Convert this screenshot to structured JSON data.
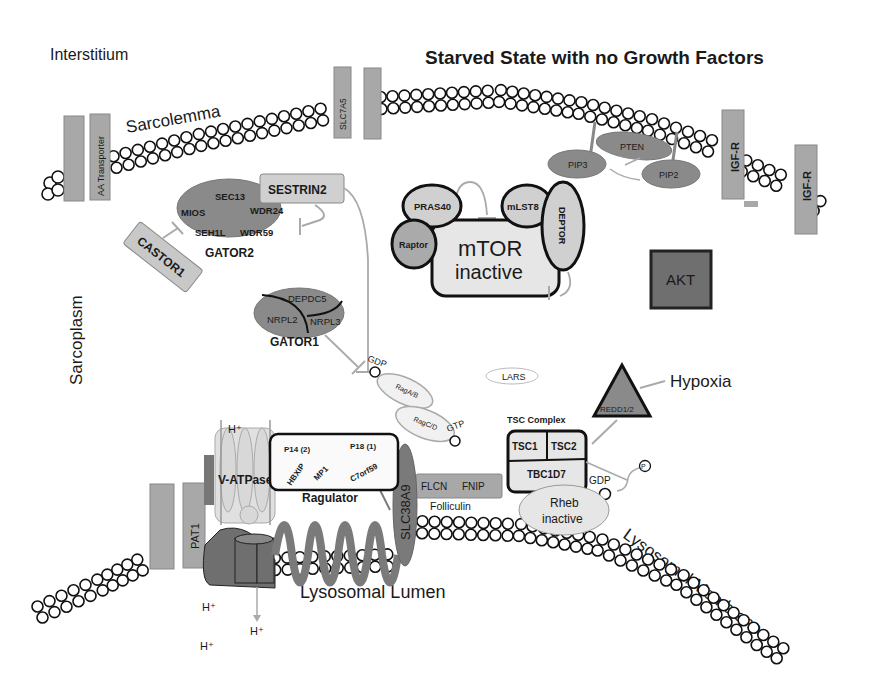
{
  "title": "Starved State with no Growth Factors",
  "regions": {
    "interstitium": "Interstitium",
    "sarcolemma": "Sarcolemma",
    "sarcoplasm": "Sarcoplasm",
    "lysosomal_lumen": "Lysosomal Lumen",
    "lysosomal_membrane": "Lysosomal Membrane"
  },
  "sarcolemma_proteins": {
    "aa_transporter": "AA Transporter",
    "slc7a5": "SLC7A5",
    "igfr_1": "IGF-R",
    "igfr_2": "IGF-R"
  },
  "pi3k_pathway": {
    "pten": "PTEN",
    "pip3": "PIP3",
    "pip2": "PIP2",
    "akt": "AKT"
  },
  "gator2": {
    "label": "GATOR2",
    "subunits": [
      "SEC13",
      "MIOS",
      "WDR24",
      "SEH1L",
      "WDR59"
    ]
  },
  "sestrin2": "SESTRIN2",
  "castor1": "CASTOR1",
  "gator1": {
    "label": "GATOR1",
    "subunits": [
      "DEPDC5",
      "NRPL2",
      "NRPL3"
    ]
  },
  "mtor": {
    "line1": "mTOR",
    "line2": "inactive",
    "pras40": "PRAS40",
    "raptor": "Raptor",
    "mlst8": "mLST8",
    "deptor": "DEPTOR"
  },
  "rag": {
    "gdp": "GDP",
    "gtp": "GTP",
    "ragab": "RagA/B",
    "ragcd": "RagC/D"
  },
  "lars": "LARS",
  "hypoxia": "Hypoxia",
  "redd": "REDD1/2",
  "tsc": {
    "label": "TSC Complex",
    "tsc1": "TSC1",
    "tsc2": "TSC2",
    "tbc1d7": "TBC1D7"
  },
  "rheb": {
    "gdp": "GDP",
    "phosphate": "P",
    "line1": "Rheb",
    "line2": "inactive"
  },
  "folliculin": {
    "label": "Folliculin",
    "flcn": "FLCN",
    "fnip": "FNIP"
  },
  "ragulator": {
    "label": "Ragulator",
    "p14": "P14 (2)",
    "p18": "P18 (1)",
    "hbxip": "HBXIP",
    "mp1": "MP1",
    "c7orf59": "C7orf59"
  },
  "slc38a9": "SLC38A9",
  "vatpase": "V-ATPase",
  "pat1": "PAT1",
  "protons": {
    "top": "H⁺",
    "bottom1": "H⁺",
    "bottom2": "H⁺",
    "bottom3": "H⁺"
  }
}
